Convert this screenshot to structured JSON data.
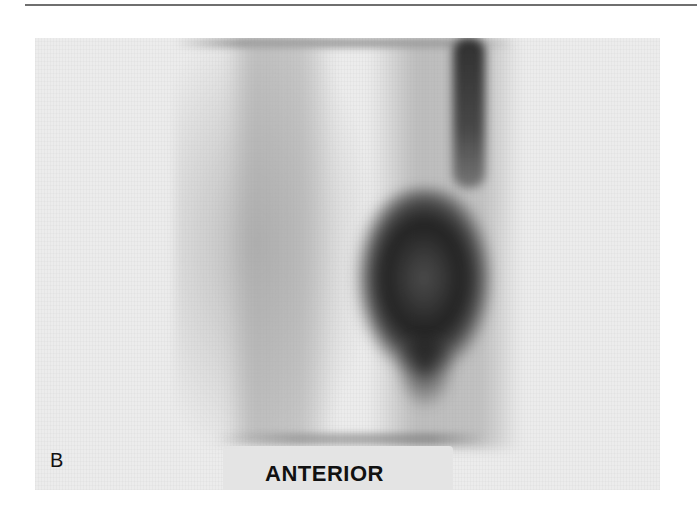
{
  "figure": {
    "panel_letter": "B",
    "view_label": "ANTERIOR",
    "image_type": "grayscale scintigraphy scan",
    "colors": {
      "background": "#ffffff",
      "panel": "#ececec",
      "uptake_dark": "#1e1e1e",
      "rule": "#6f6f6f",
      "text": "#111111"
    }
  }
}
